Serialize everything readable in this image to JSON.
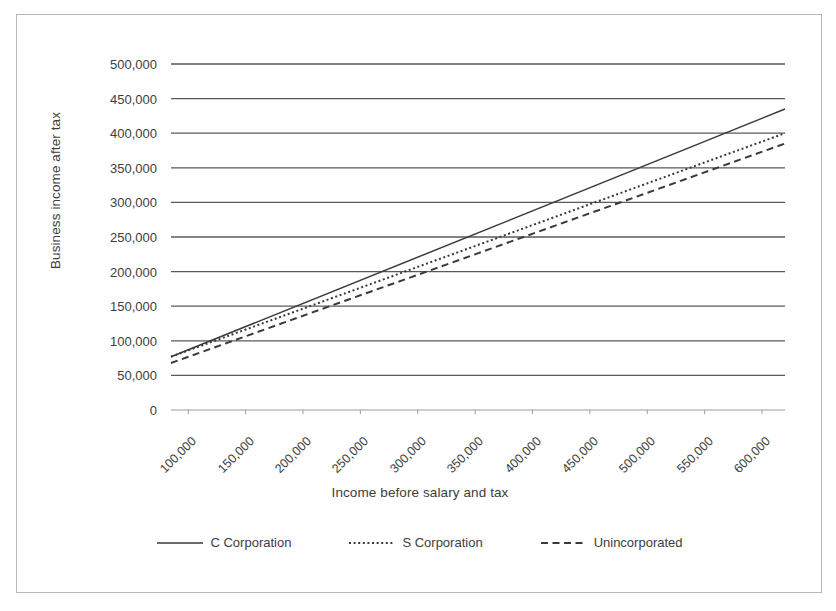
{
  "chart_data": {
    "type": "line",
    "title": "",
    "xlabel": "Income before salary and tax",
    "ylabel": "Business income after tax",
    "x": [
      100000,
      150000,
      200000,
      250000,
      300000,
      350000,
      400000,
      450000,
      500000,
      550000,
      600000
    ],
    "xlim": [
      85000,
      620000
    ],
    "ylim": [
      0,
      500000
    ],
    "xtick_labels": [
      "100,000",
      "150,000",
      "200,000",
      "250,000",
      "300,000",
      "350,000",
      "400,000",
      "450,000",
      "500,000",
      "550,000",
      "600,000"
    ],
    "ytick_labels": [
      "0",
      "50,000",
      "100,000",
      "150,000",
      "200,000",
      "250,000",
      "300,000",
      "350,000",
      "400,000",
      "450,000",
      "500,000"
    ],
    "ytick_values": [
      0,
      50000,
      100000,
      150000,
      200000,
      250000,
      300000,
      350000,
      400000,
      450000,
      500000
    ],
    "grid": "horizontal",
    "legend_position": "bottom",
    "series": [
      {
        "name": "C Corporation",
        "style": "solid",
        "color": "#3a3a3a",
        "x": [
          85000,
          620000
        ],
        "values": [
          77000,
          435000
        ],
        "data_x": [
          100000,
          150000,
          200000,
          250000,
          300000,
          350000,
          400000,
          450000,
          500000,
          550000,
          600000
        ],
        "data_values": [
          87000,
          120000,
          154000,
          187000,
          221000,
          254000,
          288000,
          321000,
          355000,
          388000,
          422000
        ]
      },
      {
        "name": "S Corporation",
        "style": "dotted",
        "color": "#3a3a3a",
        "x": [
          85000,
          620000
        ],
        "values": [
          77000,
          400000
        ],
        "data_x": [
          100000,
          150000,
          200000,
          250000,
          300000,
          350000,
          400000,
          450000,
          500000,
          550000,
          600000
        ],
        "data_values": [
          86000,
          116000,
          147000,
          178000,
          208000,
          239000,
          269000,
          300000,
          330000,
          361000,
          391000
        ]
      },
      {
        "name": "Unincorporated",
        "style": "dashed",
        "color": "#3a3a3a",
        "x": [
          85000,
          620000
        ],
        "values": [
          68000,
          385000
        ],
        "data_x": [
          100000,
          150000,
          200000,
          250000,
          300000,
          350000,
          400000,
          450000,
          500000,
          550000,
          600000
        ],
        "data_values": [
          77000,
          107000,
          136000,
          166000,
          195000,
          225000,
          254000,
          284000,
          313000,
          343000,
          372000
        ]
      }
    ]
  },
  "axes": {
    "y_title": "Business income after tax",
    "x_title": "Income before salary and tax"
  },
  "legend": {
    "items": [
      {
        "label": "C Corporation",
        "style": "solid"
      },
      {
        "label": "S Corporation",
        "style": "dotted"
      },
      {
        "label": "Unincorporated",
        "style": "dashed"
      }
    ]
  },
  "colors": {
    "line": "#3a3a3a",
    "grid": "#5a5a5a",
    "border": "#b9b9b9",
    "text": "#3d3d3d"
  }
}
